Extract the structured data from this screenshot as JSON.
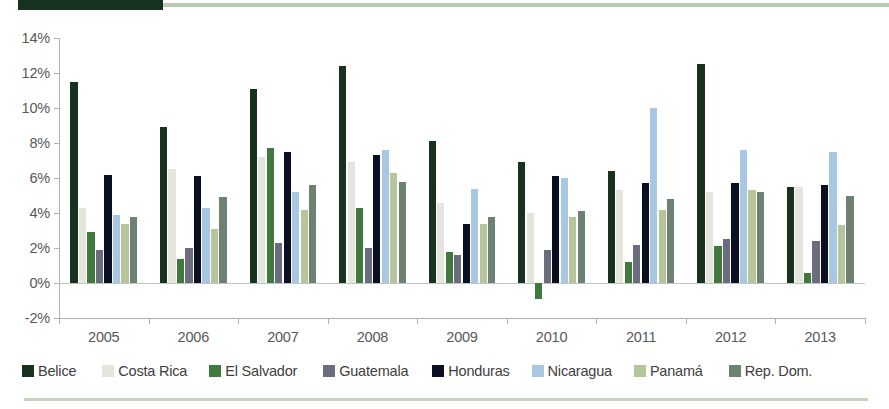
{
  "decor": {
    "top_bar_color": "#17331f",
    "top_rule_color": "#b9cdb0",
    "bottom_rule_color": "#c4d6ba"
  },
  "axis": {
    "y_tick_labels": [
      "14%",
      "12%",
      "10%",
      "8%",
      "6%",
      "4%",
      "2%",
      "0%",
      "-2%"
    ],
    "x_tick_labels": [
      "2005",
      "2006",
      "2007",
      "2008",
      "2009",
      "2010",
      "2011",
      "2012",
      "2013"
    ]
  },
  "legend": {
    "items": [
      {
        "label": "Belice",
        "color": "#17331f"
      },
      {
        "label": "Costa Rica",
        "color": "#e4e6de"
      },
      {
        "label": "El Salvador",
        "color": "#3f7a3c"
      },
      {
        "label": "Guatemala",
        "color": "#6b6d7c"
      },
      {
        "label": "Honduras",
        "color": "#0a0f21"
      },
      {
        "label": "Nicaragua",
        "color": "#a8c7e2"
      },
      {
        "label": "Panamá",
        "color": "#b6c69a"
      },
      {
        "label": "Rep. Dom.",
        "color": "#6e8274"
      }
    ]
  },
  "chart_data": {
    "type": "bar",
    "title": "",
    "xlabel": "",
    "ylabel": "",
    "ylim": [
      -2,
      14
    ],
    "ytick_step": 2,
    "grid": false,
    "legend_position": "bottom",
    "categories": [
      "2005",
      "2006",
      "2007",
      "2008",
      "2009",
      "2010",
      "2011",
      "2012",
      "2013"
    ],
    "series": [
      {
        "name": "Belice",
        "color": "#17331f",
        "values": [
          11.5,
          8.9,
          11.1,
          12.4,
          8.1,
          6.9,
          6.4,
          12.5,
          5.5
        ]
      },
      {
        "name": "Costa Rica",
        "color": "#e4e6de",
        "values": [
          4.3,
          6.5,
          7.2,
          6.9,
          4.6,
          4.0,
          5.3,
          5.2,
          5.5
        ]
      },
      {
        "name": "El Salvador",
        "color": "#3f7a3c",
        "values": [
          2.9,
          1.4,
          7.7,
          4.3,
          1.8,
          -0.9,
          1.2,
          2.1,
          0.6
        ]
      },
      {
        "name": "Guatemala",
        "color": "#6b6d7c",
        "values": [
          1.9,
          2.0,
          2.3,
          2.0,
          1.6,
          1.9,
          2.2,
          2.5,
          2.4
        ]
      },
      {
        "name": "Honduras",
        "color": "#0a0f21",
        "values": [
          6.2,
          6.1,
          7.5,
          7.3,
          3.4,
          6.1,
          5.7,
          5.7,
          5.6
        ]
      },
      {
        "name": "Nicaragua",
        "color": "#a8c7e2",
        "values": [
          3.9,
          4.3,
          5.2,
          7.6,
          5.4,
          6.0,
          10.0,
          7.6,
          7.5
        ]
      },
      {
        "name": "Panamá",
        "color": "#b6c69a",
        "values": [
          3.4,
          3.1,
          4.2,
          6.3,
          3.4,
          3.8,
          4.2,
          5.3,
          3.3
        ]
      },
      {
        "name": "Rep. Dom.",
        "color": "#6e8274",
        "values": [
          3.8,
          4.9,
          5.6,
          5.8,
          3.8,
          4.1,
          4.8,
          5.2,
          5.0
        ]
      }
    ]
  }
}
